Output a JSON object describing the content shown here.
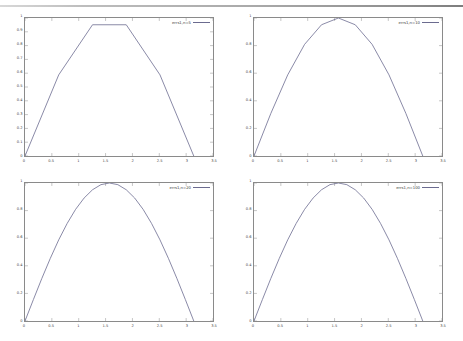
{
  "window": {
    "top_rule_color": "#9a9a9a",
    "background": "#ffffff"
  },
  "figure": {
    "layout": "2x2 grid of line plots",
    "line_color": "#6b6b8f",
    "axis_color": "#8a8a8a",
    "tick_label_color": "#444444"
  },
  "chart_data": [
    {
      "type": "line",
      "title": "",
      "xlabel": "",
      "ylabel": "",
      "xlim": [
        0,
        3.5
      ],
      "ylim": [
        0,
        1
      ],
      "xticks": [
        "0",
        "0.5",
        "1",
        "1.5",
        "2",
        "2.5",
        "3",
        "3.5"
      ],
      "yticks": [
        "0",
        "0.1",
        "0.2",
        "0.3",
        "0.4",
        "0.5",
        "0.6",
        "0.7",
        "0.8",
        "0.9",
        "1"
      ],
      "grid": false,
      "legend_position": "top-right",
      "series": [
        {
          "name": "errs1,n=5",
          "x": [
            0,
            0.628,
            1.257,
            1.885,
            2.513,
            3.142
          ],
          "values": [
            0,
            0.588,
            0.951,
            0.951,
            0.588,
            0
          ]
        }
      ]
    },
    {
      "type": "line",
      "title": "",
      "xlabel": "",
      "ylabel": "",
      "xlim": [
        0,
        3.5
      ],
      "ylim": [
        0,
        1
      ],
      "xticks": [
        "0",
        "0.5",
        "1",
        "1.5",
        "2",
        "2.5",
        "3",
        "3.5"
      ],
      "yticks": [
        "0",
        "0.2",
        "0.4",
        "0.6",
        "0.8",
        "1"
      ],
      "grid": false,
      "legend_position": "top-right",
      "series": [
        {
          "name": "errs1,n=10",
          "x": [
            0,
            0.314,
            0.628,
            0.942,
            1.257,
            1.571,
            1.885,
            2.199,
            2.513,
            2.827,
            3.142
          ],
          "values": [
            0,
            0.309,
            0.588,
            0.809,
            0.951,
            1.0,
            0.951,
            0.809,
            0.588,
            0.309,
            0
          ]
        }
      ]
    },
    {
      "type": "line",
      "title": "",
      "xlabel": "",
      "ylabel": "",
      "xlim": [
        0,
        3.5
      ],
      "ylim": [
        0,
        1
      ],
      "xticks": [
        "0",
        "0.5",
        "1",
        "1.5",
        "2",
        "2.5",
        "3",
        "3.5"
      ],
      "yticks": [
        "0",
        "0.2",
        "0.4",
        "0.6",
        "0.8",
        "1"
      ],
      "grid": false,
      "legend_position": "top-right",
      "series": [
        {
          "name": "errs1,n=20",
          "x": [
            0,
            0.157,
            0.314,
            0.471,
            0.628,
            0.785,
            0.942,
            1.1,
            1.257,
            1.414,
            1.571,
            1.728,
            1.885,
            2.042,
            2.199,
            2.356,
            2.513,
            2.67,
            2.827,
            2.985,
            3.142
          ],
          "values": [
            0,
            0.156,
            0.309,
            0.454,
            0.588,
            0.707,
            0.809,
            0.891,
            0.951,
            0.988,
            1.0,
            0.988,
            0.951,
            0.891,
            0.809,
            0.707,
            0.588,
            0.454,
            0.309,
            0.156,
            0
          ]
        }
      ]
    },
    {
      "type": "line",
      "title": "",
      "xlabel": "",
      "ylabel": "",
      "xlim": [
        0,
        3.5
      ],
      "ylim": [
        0,
        1
      ],
      "xticks": [
        "0",
        "0.5",
        "1",
        "1.5",
        "2",
        "2.5",
        "3",
        "3.5"
      ],
      "yticks": [
        "0",
        "0.2",
        "0.4",
        "0.6",
        "0.8",
        "1"
      ],
      "grid": false,
      "legend_position": "top-right",
      "series": [
        {
          "name": "errs1,n=100",
          "x": [
            0,
            0.157,
            0.314,
            0.471,
            0.628,
            0.785,
            0.942,
            1.1,
            1.257,
            1.414,
            1.571,
            1.728,
            1.885,
            2.042,
            2.199,
            2.356,
            2.513,
            2.67,
            2.827,
            2.985,
            3.142
          ],
          "values": [
            0,
            0.156,
            0.309,
            0.454,
            0.588,
            0.707,
            0.809,
            0.891,
            0.951,
            0.988,
            1.0,
            0.988,
            0.951,
            0.891,
            0.809,
            0.707,
            0.588,
            0.454,
            0.309,
            0.156,
            0
          ]
        }
      ]
    }
  ]
}
